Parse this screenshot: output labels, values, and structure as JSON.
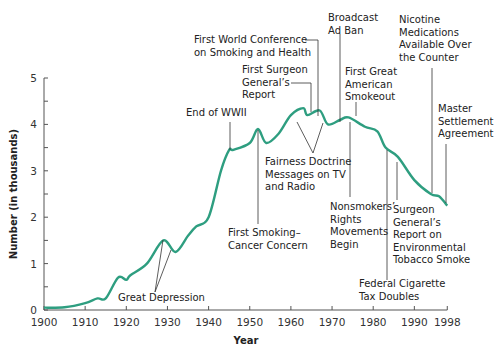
{
  "chart_data": {
    "type": "line",
    "title": "",
    "xlabel": "Year",
    "ylabel": "Number (in thousands)",
    "xlim": [
      1900,
      1998
    ],
    "ylim": [
      0,
      5
    ],
    "grid": false,
    "legend": null,
    "x_ticks": [
      1900,
      1910,
      1920,
      1930,
      1940,
      1950,
      1960,
      1970,
      1980,
      1990,
      1998
    ],
    "y_ticks": [
      0,
      1,
      2,
      3,
      4,
      5
    ],
    "line_color": "#2e9e80",
    "series": [
      {
        "name": "Per capita cigarette consumption",
        "x": [
          1900,
          1905,
          1910,
          1913,
          1915,
          1918,
          1920,
          1921,
          1925,
          1929,
          1932,
          1935,
          1937,
          1940,
          1943,
          1945,
          1946,
          1950,
          1952,
          1954,
          1957,
          1960,
          1963,
          1964,
          1967,
          1969,
          1972,
          1974,
          1978,
          1981,
          1983,
          1986,
          1990,
          1994,
          1996,
          1998
        ],
        "values": [
          0.05,
          0.06,
          0.15,
          0.25,
          0.25,
          0.7,
          0.65,
          0.75,
          1.0,
          1.5,
          1.25,
          1.6,
          1.8,
          2.0,
          3.0,
          3.45,
          3.45,
          3.6,
          3.9,
          3.6,
          3.8,
          4.2,
          4.35,
          4.2,
          4.3,
          4.0,
          4.1,
          4.15,
          3.95,
          3.85,
          3.5,
          3.3,
          2.8,
          2.5,
          2.45,
          2.25
        ]
      }
    ],
    "annotations": [
      {
        "id": "great-depression",
        "lines": [
          "Great Depression"
        ]
      },
      {
        "id": "end-wwii",
        "lines": [
          "End of WWII"
        ]
      },
      {
        "id": "first-smoking-cancer",
        "lines": [
          "First Smoking–",
          "Cancer Concern"
        ]
      },
      {
        "id": "first-world-conference",
        "lines": [
          "First World Conference",
          "on Smoking and Health"
        ]
      },
      {
        "id": "first-surgeon-general",
        "lines": [
          "First Surgeon",
          "General’s",
          "Report"
        ]
      },
      {
        "id": "fairness-doctrine",
        "lines": [
          "Fairness Doctrine",
          "Messages on TV",
          "and Radio"
        ]
      },
      {
        "id": "broadcast-ad-ban",
        "lines": [
          "Broadcast",
          "Ad Ban"
        ]
      },
      {
        "id": "first-great-american-smokeout",
        "lines": [
          "First Great",
          "American",
          "Smokeout"
        ]
      },
      {
        "id": "nonsmokers-rights",
        "lines": [
          "Nonsmokers’",
          "Rights",
          "Movements",
          "Begin"
        ]
      },
      {
        "id": "federal-cigarette-tax",
        "lines": [
          "Federal Cigarette",
          "Tax Doubles"
        ]
      },
      {
        "id": "surgeon-general-ets",
        "lines": [
          "Surgeon",
          "General’s",
          "Report on",
          "Environmental",
          "Tobacco Smoke"
        ]
      },
      {
        "id": "nicotine-medications",
        "lines": [
          "Nicotine",
          "Medications",
          "Available Over",
          "the Counter"
        ]
      },
      {
        "id": "master-settlement",
        "lines": [
          "Master",
          "Settlement",
          "Agreement"
        ]
      }
    ]
  }
}
